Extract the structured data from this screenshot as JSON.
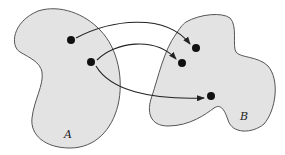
{
  "diagram": {
    "type": "function-mapping",
    "sets": [
      {
        "id": "A",
        "label": "A",
        "fill": "#e3e3e3",
        "stroke": "#555555"
      },
      {
        "id": "B",
        "label": "B",
        "fill": "#e3e3e3",
        "stroke": "#555555"
      }
    ],
    "points": {
      "A": [
        {
          "x": 71,
          "y": 40
        },
        {
          "x": 91,
          "y": 62
        }
      ],
      "B": [
        {
          "x": 196,
          "y": 48
        },
        {
          "x": 182,
          "y": 63
        },
        {
          "x": 211,
          "y": 96
        }
      ]
    },
    "arrows": [
      {
        "from": "A.0",
        "to": "B.0"
      },
      {
        "from": "A.1",
        "to": "B.1"
      },
      {
        "from": "A.1",
        "to": "B.2"
      }
    ],
    "colors": {
      "point": "#111111",
      "arrow": "#222222",
      "background": "#ffffff"
    }
  }
}
